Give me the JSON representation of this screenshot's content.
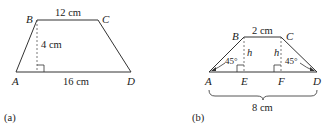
{
  "figure_a": {
    "caption": "(a)",
    "vertices": {
      "A": "A",
      "B": "B",
      "C": "C",
      "D": "D"
    },
    "top_base": "12 cm",
    "height": "4 cm",
    "bottom_base": "16 cm"
  },
  "figure_b": {
    "caption": "(b)",
    "vertices": {
      "A": "A",
      "B": "B",
      "C": "C",
      "D": "D",
      "E": "E",
      "F": "F"
    },
    "top_base": "2 cm",
    "height_left": "h",
    "height_right": "h",
    "angle_left": "45°",
    "angle_right": "45°",
    "bottom_total": "8 cm"
  }
}
